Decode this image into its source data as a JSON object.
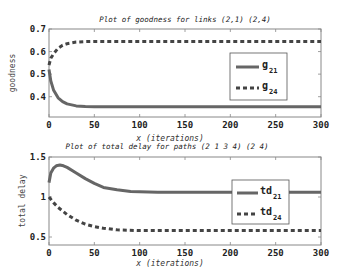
{
  "chart_data": [
    {
      "type": "line",
      "title": "Plot of goodness for links (2,1) (2,4)",
      "xlabel": "x (iterations)",
      "ylabel": "goodness",
      "xlim": [
        0,
        300
      ],
      "ylim": [
        0.31,
        0.7
      ],
      "xticks": [
        0,
        50,
        100,
        150,
        200,
        250,
        300
      ],
      "yticks": [
        0.4,
        0.5,
        0.6,
        0.7
      ],
      "ytick_labels": [
        "0.4",
        "0.5",
        "0.6",
        "0.7"
      ],
      "grid": false,
      "legend_position": "center-right",
      "series": [
        {
          "name": "g21",
          "label_main": "g",
          "label_sub": "21",
          "style": "solid",
          "color": "#666666",
          "x": [
            0,
            2,
            5,
            10,
            15,
            20,
            30,
            40,
            50,
            75,
            100,
            150,
            200,
            250,
            300
          ],
          "y": [
            0.52,
            0.47,
            0.43,
            0.395,
            0.378,
            0.368,
            0.359,
            0.356,
            0.355,
            0.355,
            0.355,
            0.355,
            0.355,
            0.355,
            0.355
          ]
        },
        {
          "name": "g24",
          "label_main": "g",
          "label_sub": "24",
          "style": "dashed",
          "color": "#444444",
          "x": [
            0,
            2,
            5,
            10,
            15,
            20,
            30,
            40,
            50,
            75,
            100,
            150,
            200,
            250,
            300
          ],
          "y": [
            0.54,
            0.57,
            0.59,
            0.615,
            0.628,
            0.635,
            0.642,
            0.644,
            0.645,
            0.645,
            0.645,
            0.645,
            0.645,
            0.645,
            0.645
          ]
        }
      ]
    },
    {
      "type": "line",
      "title": "Plot of total delay for paths (2 1 3 4) (2 4)",
      "xlabel": "x (iterations)",
      "ylabel": "total delay",
      "xlim": [
        0,
        300
      ],
      "ylim": [
        0.4,
        1.5
      ],
      "xticks": [
        0,
        50,
        100,
        150,
        200,
        250,
        300
      ],
      "yticks": [
        0.5,
        1,
        1.5
      ],
      "ytick_labels": [
        "0.5",
        "1",
        "1.5"
      ],
      "grid": false,
      "legend_position": "center-right",
      "series": [
        {
          "name": "td21",
          "label_main": "td",
          "label_sub": "21",
          "style": "solid",
          "color": "#666666",
          "x": [
            0,
            2,
            5,
            8,
            12,
            16,
            20,
            30,
            40,
            50,
            60,
            75,
            90,
            100,
            120,
            150,
            200,
            250,
            300
          ],
          "y": [
            1.18,
            1.3,
            1.36,
            1.39,
            1.4,
            1.39,
            1.37,
            1.3,
            1.23,
            1.17,
            1.12,
            1.09,
            1.07,
            1.065,
            1.06,
            1.06,
            1.06,
            1.06,
            1.06
          ]
        },
        {
          "name": "td24",
          "label_main": "td",
          "label_sub": "24",
          "style": "dashed",
          "color": "#444444",
          "x": [
            0,
            5,
            10,
            20,
            30,
            40,
            50,
            60,
            75,
            100,
            150,
            200,
            250,
            300
          ],
          "y": [
            1.0,
            0.93,
            0.87,
            0.78,
            0.71,
            0.66,
            0.63,
            0.61,
            0.59,
            0.58,
            0.58,
            0.58,
            0.58,
            0.58
          ]
        }
      ]
    }
  ]
}
